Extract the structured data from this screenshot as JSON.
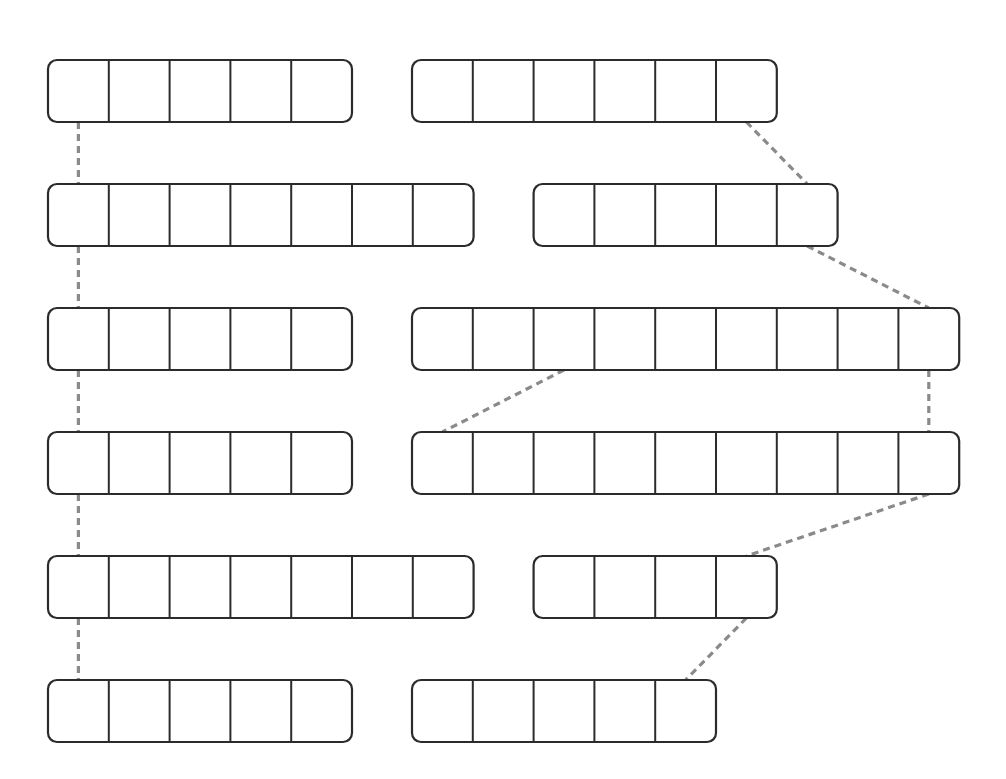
{
  "diagram": {
    "type": "array-list-linkage",
    "colors": {
      "box_stroke": "#2b2b2b",
      "connector": "#8a8a8a",
      "background": "#ffffff"
    },
    "left_column": {
      "arrays": [
        {
          "cells": 5
        },
        {
          "cells": 7
        },
        {
          "cells": 5
        },
        {
          "cells": 5
        },
        {
          "cells": 7
        },
        {
          "cells": 5
        }
      ],
      "link_style": "vertical-chain"
    },
    "right_column": {
      "arrays": [
        {
          "cells": 6,
          "indent": 0
        },
        {
          "cells": 5,
          "indent": 2
        },
        {
          "cells": 9,
          "indent": 0
        },
        {
          "cells": 9,
          "indent": 0
        },
        {
          "cells": 4,
          "indent": 2
        },
        {
          "cells": 5,
          "indent": 0
        }
      ],
      "links": [
        {
          "from_row": 0,
          "from_cell": 5,
          "to_row": 1,
          "to_cell": 4
        },
        {
          "from_row": 1,
          "from_cell": 4,
          "to_row": 2,
          "to_cell": 8
        },
        {
          "from_row": 2,
          "from_cell": 8,
          "to_row": 3,
          "to_cell": 8
        },
        {
          "from_row": 2,
          "from_cell": 2,
          "to_row": 3,
          "to_cell": 0
        },
        {
          "from_row": 3,
          "from_cell": 8,
          "to_row": 4,
          "to_cell": 3
        },
        {
          "from_row": 4,
          "from_cell": 3,
          "to_row": 5,
          "to_cell": 4
        }
      ]
    }
  }
}
